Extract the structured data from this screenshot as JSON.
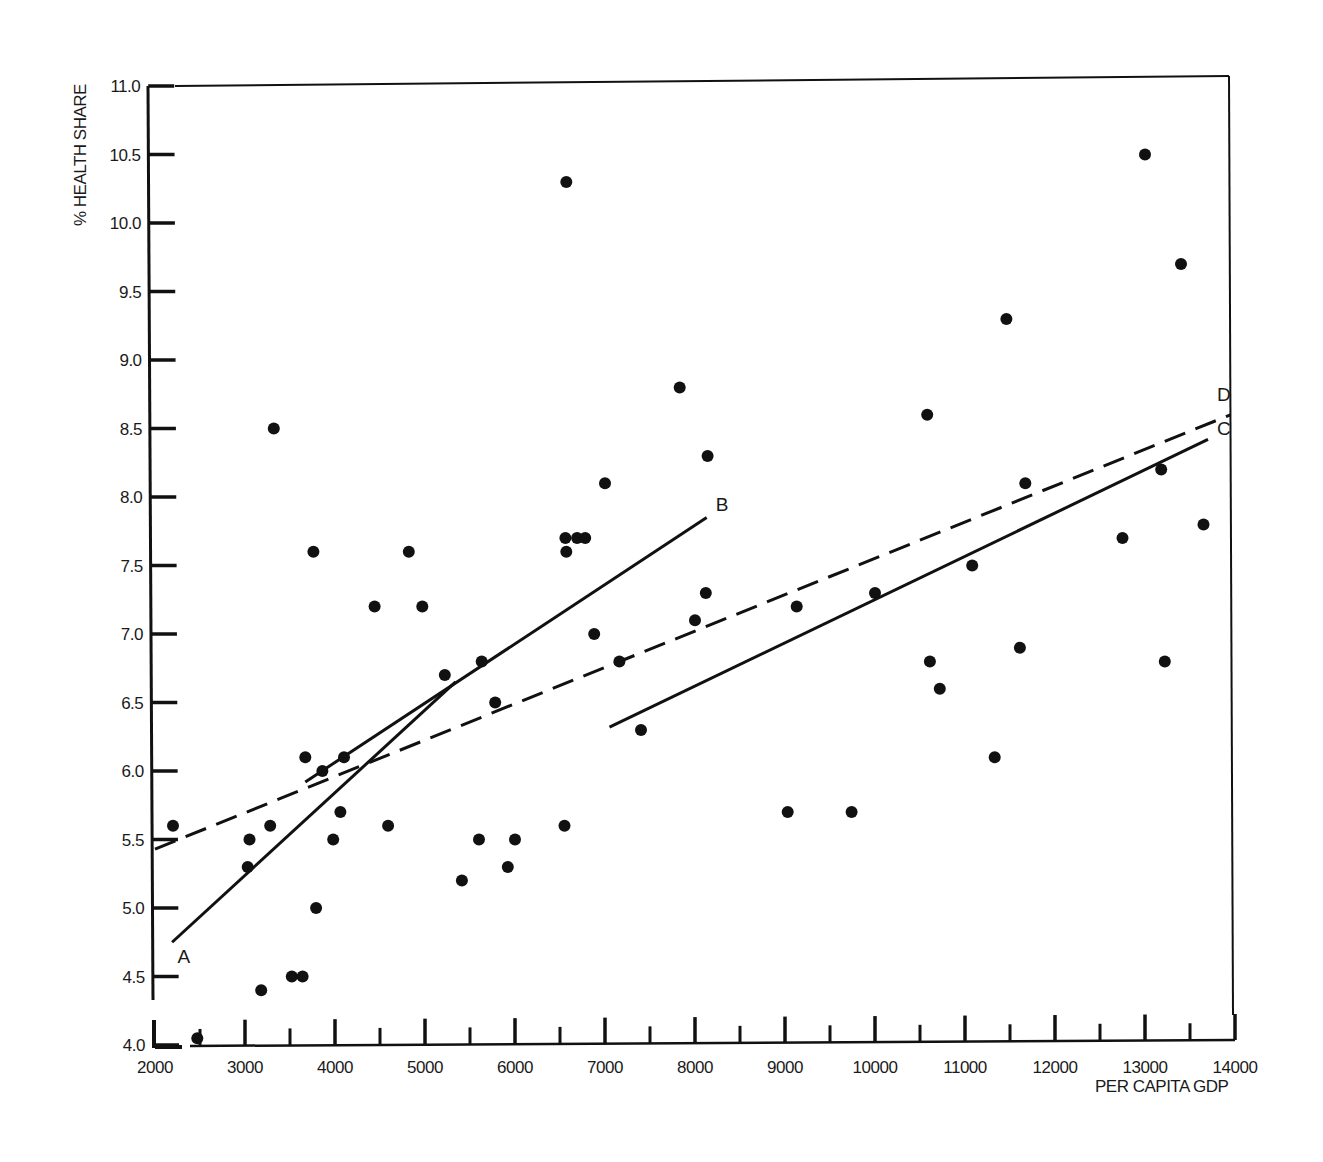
{
  "chart_data": {
    "type": "scatter",
    "title": "",
    "xlabel": "PER CAPITA GDP",
    "ylabel": "% HEALTH SHARE",
    "xlim": [
      2000,
      14000
    ],
    "ylim": [
      4.0,
      11.0
    ],
    "grid": false,
    "x_ticks": [
      "2000",
      "3000",
      "4000",
      "5000",
      "6000",
      "7000",
      "8000",
      "9000",
      "10000",
      "11000",
      "12000",
      "13000",
      "14000"
    ],
    "y_ticks": [
      "4.0",
      "4.5",
      "5.0",
      "5.5",
      "6.0",
      "6.5",
      "7.0",
      "7.5",
      "8.0",
      "8.5",
      "9.0",
      "9.5",
      "10.0",
      "10.5",
      "11.0"
    ],
    "points": [
      [
        2200,
        5.6
      ],
      [
        2470,
        4.05
      ],
      [
        3050,
        5.5
      ],
      [
        3030,
        5.3
      ],
      [
        3280,
        5.6
      ],
      [
        3180,
        4.4
      ],
      [
        3320,
        8.5
      ],
      [
        3520,
        4.5
      ],
      [
        3640,
        4.5
      ],
      [
        3670,
        6.1
      ],
      [
        3760,
        7.6
      ],
      [
        3790,
        5.0
      ],
      [
        3860,
        6.0
      ],
      [
        3980,
        5.5
      ],
      [
        4060,
        5.7
      ],
      [
        4100,
        6.1
      ],
      [
        4440,
        7.2
      ],
      [
        4590,
        5.6
      ],
      [
        4820,
        7.6
      ],
      [
        4970,
        7.2
      ],
      [
        5220,
        6.7
      ],
      [
        5410,
        5.2
      ],
      [
        5600,
        5.5
      ],
      [
        5630,
        6.8
      ],
      [
        5780,
        6.5
      ],
      [
        5920,
        5.3
      ],
      [
        6000,
        5.5
      ],
      [
        6550,
        5.6
      ],
      [
        6570,
        10.3
      ],
      [
        6560,
        7.7
      ],
      [
        6570,
        7.6
      ],
      [
        6690,
        7.7
      ],
      [
        6780,
        7.7
      ],
      [
        6880,
        7.0
      ],
      [
        7000,
        8.1
      ],
      [
        7160,
        6.8
      ],
      [
        7400,
        6.3
      ],
      [
        7830,
        8.8
      ],
      [
        8000,
        7.1
      ],
      [
        8120,
        7.3
      ],
      [
        8140,
        8.3
      ],
      [
        9030,
        5.7
      ],
      [
        9130,
        7.2
      ],
      [
        9740,
        5.7
      ],
      [
        10000,
        7.3
      ],
      [
        10580,
        8.6
      ],
      [
        10610,
        6.8
      ],
      [
        10720,
        6.6
      ],
      [
        11080,
        7.5
      ],
      [
        11330,
        6.1
      ],
      [
        11460,
        9.3
      ],
      [
        11610,
        6.9
      ],
      [
        11670,
        8.1
      ],
      [
        12750,
        7.7
      ],
      [
        13000,
        10.5
      ],
      [
        13180,
        8.2
      ],
      [
        13220,
        6.8
      ],
      [
        13400,
        9.7
      ],
      [
        13650,
        7.8
      ]
    ],
    "lines": [
      {
        "name": "A",
        "style": "solid",
        "points": [
          [
            2190,
            4.75
          ],
          [
            5340,
            6.65
          ]
        ]
      },
      {
        "name": "B",
        "style": "solid",
        "points": [
          [
            3670,
            5.92
          ],
          [
            8130,
            7.85
          ]
        ]
      },
      {
        "name": "C",
        "style": "solid",
        "points": [
          [
            7050,
            6.32
          ],
          [
            13700,
            8.42
          ]
        ]
      },
      {
        "name": "D",
        "style": "dashed",
        "points": [
          [
            2000,
            5.43
          ],
          [
            13950,
            8.6
          ]
        ]
      }
    ],
    "annotations": [
      {
        "text": "A",
        "x": 2250,
        "y": 4.6
      },
      {
        "text": "B",
        "x": 8230,
        "y": 7.9
      },
      {
        "text": "C",
        "x": 13800,
        "y": 8.45
      },
      {
        "text": "D",
        "x": 13800,
        "y": 8.7
      }
    ],
    "colors": {
      "ink": "#111111",
      "background": "#ffffff"
    }
  }
}
